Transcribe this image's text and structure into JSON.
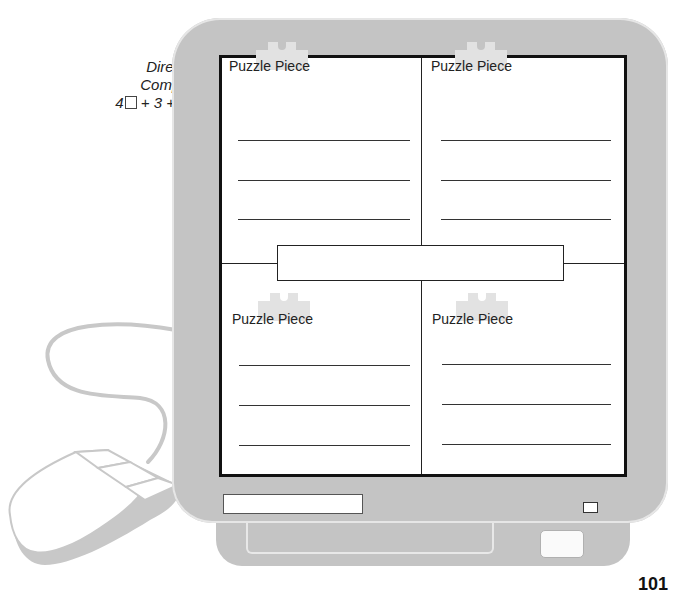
{
  "directions": {
    "line1": "Directions:",
    "line2": "Complete a",
    "formula_prefix": "4",
    "formula_suffix": " + 3 + C + V"
  },
  "screen": {
    "panels": [
      {
        "title": "Puzzle Piece",
        "position": "top-left"
      },
      {
        "title": "Puzzle Piece",
        "position": "top-right"
      },
      {
        "title": "Puzzle Piece",
        "position": "bottom-left"
      },
      {
        "title": "Puzzle Piece",
        "position": "bottom-right"
      }
    ],
    "center_box_text": ""
  },
  "bezel": {
    "slot_text": ""
  },
  "page_number": "101",
  "colors": {
    "monitor_gray": "#c4c4c4",
    "screen_border": "#111111",
    "puzzle_icon": "#e2e2e2",
    "mouse_gray": "#c8c8c8"
  }
}
